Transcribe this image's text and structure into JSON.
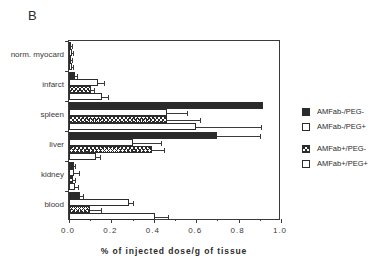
{
  "panel": {
    "label": "B"
  },
  "chart_data": {
    "type": "bar",
    "orientation": "horizontal",
    "title": "",
    "xlabel": "% of injected dose/g of tissue",
    "ylabel": "",
    "xlim": [
      0.0,
      1.0
    ],
    "xticks": [
      0.0,
      0.2,
      0.4,
      0.6,
      0.8,
      1.0
    ],
    "xtick_labels": [
      "0.0",
      "0.2",
      "0.4",
      "0.6",
      "0.8",
      "1.0"
    ],
    "grid": false,
    "legend_position": "right",
    "categories": [
      "norm. myocard",
      "infarct",
      "spleen",
      "liver",
      "kidney",
      "blood"
    ],
    "series": [
      {
        "name": "AMFab-/PEG-",
        "fill": "solid",
        "values": [
          0.008,
          0.03,
          0.915,
          0.7,
          0.022,
          0.05
        ],
        "errors": [
          0.004,
          0.008,
          0.0,
          0.2,
          0.008,
          0.015
        ]
      },
      {
        "name": "AMFab-/PEG+",
        "fill": "open",
        "values": [
          0.012,
          0.135,
          0.462,
          0.3,
          0.025,
          0.282
        ],
        "errors": [
          0.006,
          0.03,
          0.095,
          0.135,
          0.02,
          0.022
        ]
      },
      {
        "name": "AMFab+/PEG-",
        "fill": "cross",
        "values": [
          0.01,
          0.105,
          0.462,
          0.39,
          0.02,
          0.1
        ],
        "errors": [
          0.005,
          0.012,
          0.155,
          0.06,
          0.01,
          0.05
        ]
      },
      {
        "name": "AMFab+/PEG+",
        "fill": "open",
        "values": [
          0.014,
          0.155,
          0.6,
          0.125,
          0.03,
          0.408
        ],
        "errors": [
          0.007,
          0.03,
          0.305,
          0.022,
          0.012,
          0.06
        ]
      }
    ]
  },
  "legend": {
    "items": [
      {
        "label": "AMFab-/PEG-",
        "fill": "solid"
      },
      {
        "label": "AMFab-/PEG+",
        "fill": "open"
      },
      {
        "label": "AMFab+/PEG-",
        "fill": "cross"
      },
      {
        "label": "AMFab+/PEG+",
        "fill": "open"
      }
    ]
  },
  "colors": {
    "solid": "#2a2a2a",
    "open": "#ffffff",
    "line": "#3a3a3a"
  }
}
